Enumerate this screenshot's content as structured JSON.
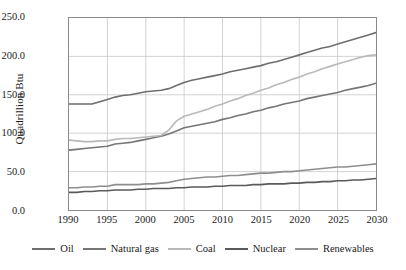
{
  "chart_data": {
    "type": "line",
    "title": "",
    "xlabel": "",
    "ylabel": "Quadrillion Btu",
    "xlim": [
      1990,
      2030
    ],
    "ylim": [
      0,
      250
    ],
    "grid": true,
    "legend_position": "bottom",
    "x_ticks": [
      "1990",
      "1995",
      "2000",
      "2005",
      "2010",
      "2015",
      "2020",
      "2025",
      "2030"
    ],
    "y_ticks": [
      "0.0",
      "50.0",
      "100.0",
      "150.0",
      "200.0",
      "250.0"
    ],
    "x": [
      1990,
      1991,
      1992,
      1993,
      1994,
      1995,
      1996,
      1997,
      1998,
      1999,
      2000,
      2001,
      2002,
      2003,
      2004,
      2005,
      2006,
      2007,
      2008,
      2009,
      2010,
      2011,
      2012,
      2013,
      2014,
      2015,
      2016,
      2017,
      2018,
      2019,
      2020,
      2021,
      2022,
      2023,
      2024,
      2025,
      2026,
      2027,
      2028,
      2029,
      2030
    ],
    "series": [
      {
        "name": "Oil",
        "color": "#6e6e6e",
        "values": [
          138,
          138,
          138,
          138,
          141,
          144,
          147,
          149,
          150,
          152,
          154,
          155,
          156,
          158,
          162,
          166,
          169,
          171,
          173,
          175,
          177,
          180,
          182,
          184,
          186,
          188,
          191,
          193,
          196,
          199,
          202,
          205,
          208,
          211,
          213,
          216,
          219,
          222,
          225,
          228,
          231
        ]
      },
      {
        "name": "Natural gas",
        "color": "#767676",
        "values": [
          78,
          79,
          80,
          81,
          82,
          83,
          86,
          87,
          88,
          90,
          92,
          94,
          96,
          99,
          103,
          107,
          109,
          111,
          113,
          115,
          118,
          120,
          123,
          125,
          128,
          130,
          133,
          135,
          138,
          140,
          142,
          145,
          147,
          149,
          151,
          153,
          156,
          158,
          160,
          162,
          165
        ]
      },
      {
        "name": "Coal",
        "color": "#b9b9b9",
        "values": [
          91,
          90,
          89,
          89,
          90,
          90,
          92,
          93,
          93,
          94,
          95,
          96,
          97,
          104,
          116,
          122,
          125,
          128,
          131,
          135,
          138,
          142,
          145,
          149,
          152,
          156,
          159,
          163,
          166,
          170,
          173,
          177,
          180,
          184,
          187,
          190,
          193,
          196,
          199,
          201,
          202
        ]
      },
      {
        "name": "Nuclear",
        "color": "#5a5a5a",
        "values": [
          23,
          23,
          24,
          24,
          25,
          25,
          26,
          26,
          26,
          27,
          27,
          28,
          28,
          28,
          29,
          29,
          30,
          30,
          30,
          31,
          31,
          32,
          32,
          32,
          33,
          33,
          34,
          34,
          34,
          35,
          35,
          36,
          36,
          37,
          37,
          38,
          38,
          39,
          39,
          40,
          41
        ]
      },
      {
        "name": "Renewables",
        "color": "#8e8e8e",
        "values": [
          29,
          29,
          30,
          30,
          31,
          31,
          33,
          33,
          33,
          33,
          34,
          34,
          35,
          36,
          38,
          40,
          41,
          42,
          43,
          43,
          44,
          45,
          45,
          46,
          47,
          48,
          48,
          49,
          50,
          50,
          51,
          52,
          53,
          54,
          55,
          56,
          56,
          57,
          58,
          59,
          60
        ]
      }
    ]
  },
  "legend": {
    "items": [
      {
        "label": "Oil"
      },
      {
        "label": "Natural gas"
      },
      {
        "label": "Coal"
      },
      {
        "label": "Nuclear"
      },
      {
        "label": "Renewables"
      }
    ]
  },
  "style": {
    "grid_color": "#c8c8c8",
    "frame_color": "#8a8a8a",
    "background": "#ffffff"
  }
}
